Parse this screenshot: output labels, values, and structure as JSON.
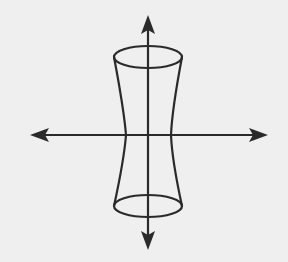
{
  "diagram": {
    "type": "hyperboloid-of-one-sheet-sketch",
    "colors": {
      "background": "#efefef",
      "stroke": "#2a2a2a"
    },
    "axes": {
      "horizontal": {
        "y": 135,
        "x1": 30,
        "x2": 268,
        "arrows": "both"
      },
      "vertical": {
        "x": 148,
        "y1": 15,
        "y2": 250,
        "arrows": "both"
      }
    },
    "surface": {
      "top_ellipse": {
        "cx": 148,
        "cy": 57,
        "rx": 34,
        "ry": 11
      },
      "bottom_ellipse": {
        "cx": 148,
        "cy": 206,
        "rx": 34,
        "ry": 11
      },
      "waist": {
        "y": 135,
        "x_left": 126,
        "x_right": 171
      }
    }
  }
}
